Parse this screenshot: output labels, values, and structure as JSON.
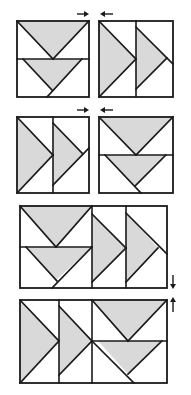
{
  "diagram": {
    "colors": {
      "background": "#ffffff",
      "goose_fill": "#d9d9d9",
      "line": "#1a1a1a"
    },
    "steps": [
      {
        "step": 1,
        "blocks": [
          "two-geese-pointing-down",
          "two-geese-pointing-right"
        ],
        "arrows": [
          "press-right",
          "press-left"
        ]
      },
      {
        "step": 2,
        "blocks": [
          "two-geese-pointing-right",
          "two-geese-pointing-down"
        ],
        "arrows": [
          "press-right",
          "press-left"
        ]
      },
      {
        "step": 3,
        "blocks": [
          "row-geese-down-then-right"
        ],
        "arrows": [
          "press-down"
        ]
      },
      {
        "step": 4,
        "blocks": [
          "row-geese-right-then-down"
        ],
        "arrows": [
          "press-up"
        ]
      }
    ]
  }
}
